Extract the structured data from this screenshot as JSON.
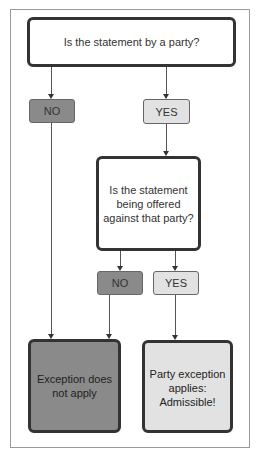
{
  "diagram": {
    "type": "flowchart",
    "nodes": {
      "q1": {
        "text": "Is the statement by a party?"
      },
      "q1_no": {
        "text": "NO"
      },
      "q1_yes": {
        "text": "YES"
      },
      "q2": {
        "text": "Is the statement being offered against that party?"
      },
      "q2_no": {
        "text": "NO"
      },
      "q2_yes": {
        "text": "YES"
      },
      "result_no": {
        "text": "Exception does not apply"
      },
      "result_yes": {
        "text": "Party exception applies: Admissible!"
      }
    },
    "edges": [
      {
        "from": "q1",
        "to": "q1_no"
      },
      {
        "from": "q1",
        "to": "q1_yes"
      },
      {
        "from": "q1_no",
        "to": "result_no"
      },
      {
        "from": "q1_yes",
        "to": "q2"
      },
      {
        "from": "q2",
        "to": "q2_no"
      },
      {
        "from": "q2",
        "to": "q2_yes"
      },
      {
        "from": "q2_no",
        "to": "result_no"
      },
      {
        "from": "q2_yes",
        "to": "result_yes"
      }
    ],
    "colors": {
      "no": "#8a8a8a",
      "yes": "#e2e2e2",
      "border": "#333333"
    }
  }
}
